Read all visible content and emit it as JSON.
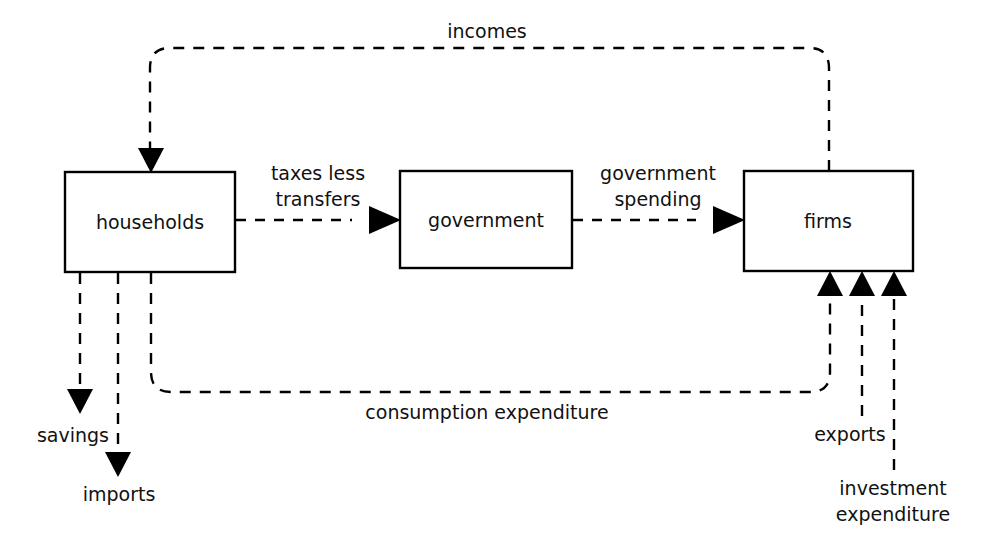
{
  "diagram": {
    "background_color": "#ffffff",
    "line_color": "#000000",
    "text_color": "#111111",
    "nodes": [
      {
        "id": "households",
        "label": "households"
      },
      {
        "id": "government",
        "label": "government"
      },
      {
        "id": "firms",
        "label": "firms"
      }
    ],
    "flows": [
      {
        "id": "incomes",
        "label": "incomes",
        "from": "firms",
        "to": "households"
      },
      {
        "id": "taxes-less-transfers",
        "label_line1": "taxes less",
        "label_line2": "transfers",
        "from": "households",
        "to": "government"
      },
      {
        "id": "government-spending",
        "label_line1": "government",
        "label_line2": "spending",
        "from": "government",
        "to": "firms"
      },
      {
        "id": "consumption-expenditure",
        "label": "consumption expenditure",
        "from": "households",
        "to": "firms"
      },
      {
        "id": "savings",
        "label": "savings",
        "from": "households",
        "to": ""
      },
      {
        "id": "imports",
        "label": "imports",
        "from": "households",
        "to": ""
      },
      {
        "id": "exports",
        "label": "exports",
        "from": "",
        "to": "firms"
      },
      {
        "id": "investment-expenditure",
        "label_line1": "investment",
        "label_line2": "expenditure",
        "from": "",
        "to": "firms"
      }
    ]
  }
}
